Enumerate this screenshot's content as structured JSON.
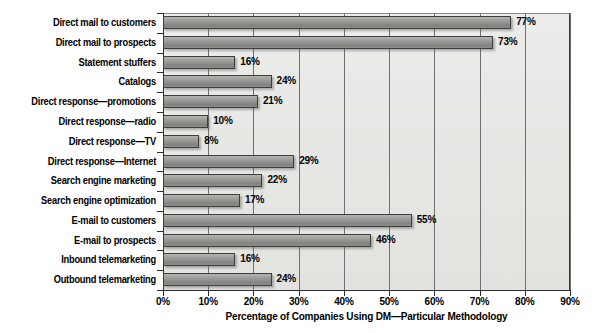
{
  "chart_data": {
    "type": "bar",
    "orientation": "horizontal",
    "title": "",
    "xlabel": "Percentage of Companies Using DM—Particular Methodology",
    "ylabel": "",
    "xlim": [
      0,
      90
    ],
    "xtick_labels": [
      "0%",
      "10%",
      "20%",
      "30%",
      "40%",
      "50%",
      "60%",
      "70%",
      "80%",
      "90%"
    ],
    "xticks": [
      0,
      10,
      20,
      30,
      40,
      50,
      60,
      70,
      80,
      90
    ],
    "grid": "vertical",
    "legend": "none",
    "value_label_suffix": "%",
    "categories": [
      "Direct mail to customers",
      "Direct mail to prospects",
      "Statement stuffers",
      "Catalogs",
      "Direct response—promotions",
      "Direct response—radio",
      "Direct response—TV",
      "Direct response—Internet",
      "Search engine marketing",
      "Search engine optimization",
      "E-mail to customers",
      "E-mail to prospects",
      "Inbound telemarketing",
      "Outbound telemarketing"
    ],
    "values": [
      77,
      73,
      16,
      24,
      21,
      10,
      8,
      29,
      22,
      17,
      55,
      46,
      16,
      24
    ],
    "value_labels": [
      "77%",
      "73%",
      "16%",
      "24%",
      "21%",
      "10%",
      "8%",
      "29%",
      "22%",
      "17%",
      "55%",
      "46%",
      "16%",
      "24%"
    ],
    "colors": {
      "bar_fill": "#93938f",
      "bar_edge": "#3d3d3d",
      "plot_background": "#e8e8e6",
      "gridline": "#6f6f6f",
      "axis": "#2e2e2e",
      "text": "#000000",
      "page_background": "#ffffff"
    }
  }
}
